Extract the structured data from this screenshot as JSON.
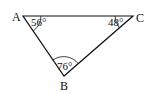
{
  "diagram": {
    "type": "triangle",
    "vertices": [
      {
        "name": "A",
        "x": 23,
        "y": 16,
        "label_x": 14,
        "label_y": 20
      },
      {
        "name": "C",
        "x": 133,
        "y": 16,
        "label_x": 136,
        "label_y": 21
      },
      {
        "name": "B",
        "x": 64,
        "y": 76,
        "label_x": 59,
        "label_y": 89
      }
    ],
    "angles": [
      {
        "vertex": "A",
        "value": "56°"
      },
      {
        "vertex": "C",
        "value": "48°"
      },
      {
        "vertex": "B",
        "value": "76°"
      }
    ],
    "stroke_color": "#111111"
  }
}
